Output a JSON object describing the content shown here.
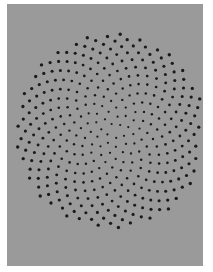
{
  "image": {
    "description": "Gray panel with dark dots arranged in a spiral phyllotaxis pattern, densest at center",
    "background_color": "#ffffff",
    "panel_color": "#9a9a9a",
    "dot_color": "#1a1a1a"
  },
  "pattern": {
    "type": "phyllotaxis",
    "center_x": 111,
    "center_y": 131,
    "count": 380,
    "spacing": 4.9,
    "scale_x": 1.0,
    "scale_y": 1.02,
    "golden_angle_deg": 137.508,
    "dot_radius_inner": 1.1,
    "dot_radius_outer": 1.7
  }
}
